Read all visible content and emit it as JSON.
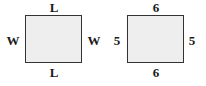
{
  "figures": [
    {
      "name": "general-rectangle",
      "top": "L",
      "bottom": "L",
      "left": "W",
      "right": "W"
    },
    {
      "name": "numeric-rectangle",
      "top": "6",
      "bottom": "6",
      "left": "5",
      "right": "5"
    }
  ],
  "colors": {
    "fill": "#eeeeee",
    "stroke": "#333333",
    "text": "#1a1a1a"
  }
}
